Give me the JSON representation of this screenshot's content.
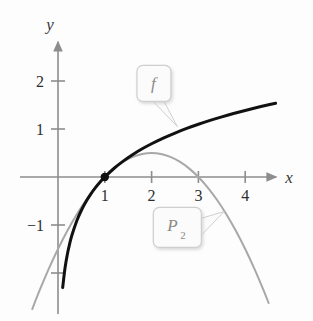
{
  "chart_data": {
    "type": "line",
    "title": "",
    "subtitle": "",
    "xlabel": "x",
    "ylabel": "y",
    "xlim": [
      -0.8,
      5.0
    ],
    "ylim": [
      -2.6,
      2.6
    ],
    "grid": false,
    "legend_position": "inline-callouts",
    "x_ticks": [
      1,
      2,
      3,
      4
    ],
    "x_tick_labels": [
      "1",
      "2",
      "3",
      "4"
    ],
    "y_ticks": [
      2,
      1,
      -1,
      -2
    ],
    "y_tick_labels": [
      "2",
      "1",
      "-1",
      ""
    ],
    "series": [
      {
        "name": "f",
        "label": "f",
        "color": "#111111",
        "width": 3.0,
        "expression": "ln(x)",
        "x": [
          0.1,
          0.15,
          0.2,
          0.25,
          0.3,
          0.4,
          0.5,
          0.6,
          0.7,
          0.8,
          0.9,
          1.0,
          1.2,
          1.4,
          1.6,
          1.8,
          2.0,
          2.25,
          2.5,
          2.75,
          3.0,
          3.25,
          3.5,
          3.75,
          4.0,
          4.25,
          4.5,
          4.65
        ],
        "y": [
          -2.303,
          -1.897,
          -1.609,
          -1.386,
          -1.204,
          -0.916,
          -0.693,
          -0.511,
          -0.357,
          -0.223,
          -0.105,
          0.0,
          0.182,
          0.336,
          0.47,
          0.588,
          0.693,
          0.811,
          0.916,
          1.012,
          1.099,
          1.179,
          1.253,
          1.322,
          1.386,
          1.447,
          1.504,
          1.537
        ]
      },
      {
        "name": "P2",
        "label": "P_2",
        "color": "#a8a8a8",
        "width": 2.0,
        "expression": "(x-1) - (x-1)^2/2",
        "x": [
          -0.55,
          -0.4,
          -0.2,
          0.0,
          0.2,
          0.4,
          0.6,
          0.8,
          1.0,
          1.2,
          1.4,
          1.6,
          1.8,
          2.0,
          2.2,
          2.4,
          2.6,
          2.8,
          3.0,
          3.2,
          3.4,
          3.6,
          3.8,
          4.0,
          4.2,
          4.4,
          4.5
        ],
        "y": [
          -2.751,
          -2.38,
          -1.92,
          -1.5,
          -1.12,
          -0.78,
          -0.48,
          -0.22,
          0.0,
          0.18,
          0.32,
          0.42,
          0.48,
          0.5,
          0.48,
          0.42,
          0.32,
          0.18,
          0.0,
          -0.22,
          -0.48,
          -0.78,
          -1.12,
          -1.5,
          -1.92,
          -2.38,
          -2.625
        ]
      }
    ],
    "points": [
      {
        "name": "tangency-point",
        "x": 1,
        "y": 0,
        "style": "filled-dot",
        "color": "#111111"
      }
    ],
    "annotations": [
      {
        "name": "f-callout",
        "text": "f",
        "subscript": "",
        "box_x": 2.05,
        "box_y": 1.95,
        "pointer_x": 2.55,
        "pointer_y": 1.05
      },
      {
        "name": "p2-callout",
        "text": "P",
        "subscript": "2",
        "box_x": 2.55,
        "box_y": -1.05,
        "pointer_x": 3.55,
        "pointer_y": -0.72
      }
    ],
    "colors": {
      "f_curve": "#111111",
      "p2_curve": "#a8a8a8",
      "axis": "#8d8d8d",
      "text": "#2e2e2e",
      "callout_border": "#cfcfcf",
      "callout_fill": "#fbfbfb",
      "background": "#fdfdfd"
    }
  },
  "figure": {
    "axis_x_label": "x",
    "axis_y_label": "y"
  }
}
